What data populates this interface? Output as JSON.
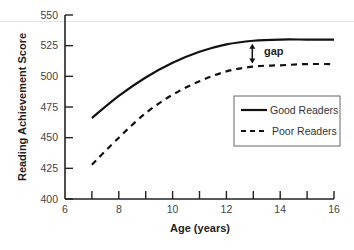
{
  "chart_data": {
    "type": "line",
    "title": "",
    "xlabel": "Age (years)",
    "ylabel": "Reading Achievement Score",
    "xlim": [
      6,
      16
    ],
    "ylim": [
      400,
      550
    ],
    "xticks": [
      6,
      8,
      10,
      12,
      14,
      16
    ],
    "yticks": [
      400,
      425,
      450,
      475,
      500,
      525,
      550
    ],
    "grid": false,
    "legend_position": "right-center, inside plot",
    "series": [
      {
        "name": "Good Readers",
        "style": "solid",
        "x": [
          7,
          8,
          9,
          10,
          11,
          12,
          13,
          14,
          15,
          16
        ],
        "y": [
          466,
          484,
          499,
          511,
          520,
          526,
          529,
          530,
          530,
          530
        ]
      },
      {
        "name": "Poor Readers",
        "style": "dashed",
        "x": [
          7,
          8,
          9,
          10,
          11,
          12,
          13,
          14,
          15,
          16
        ],
        "y": [
          428,
          450,
          470,
          485,
          496,
          504,
          508,
          509,
          510,
          510
        ]
      }
    ],
    "annotations": [
      {
        "text": "gap",
        "type": "double-arrow",
        "x": 13,
        "from": 508,
        "to": 529
      }
    ]
  },
  "labels": {
    "gap": "gap",
    "legend_good": "Good Readers",
    "legend_poor": "Poor Readers",
    "xlabel": "Age (years)",
    "ylabel": "Reading Achievement Score"
  }
}
